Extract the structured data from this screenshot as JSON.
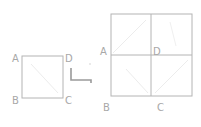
{
  "colors": {
    "stroke": "#b4b4b4",
    "faint": "#e6e6e6",
    "label": "#a8a8a8"
  },
  "left_square": {
    "labels": {
      "A": "A",
      "B": "B",
      "C": "C",
      "D": "D"
    }
  },
  "arrow": {
    "icon": "l-shaped-arrow-icon"
  },
  "right_square": {
    "labels": {
      "A": "A",
      "B": "B",
      "C": "C",
      "D": "D"
    }
  }
}
